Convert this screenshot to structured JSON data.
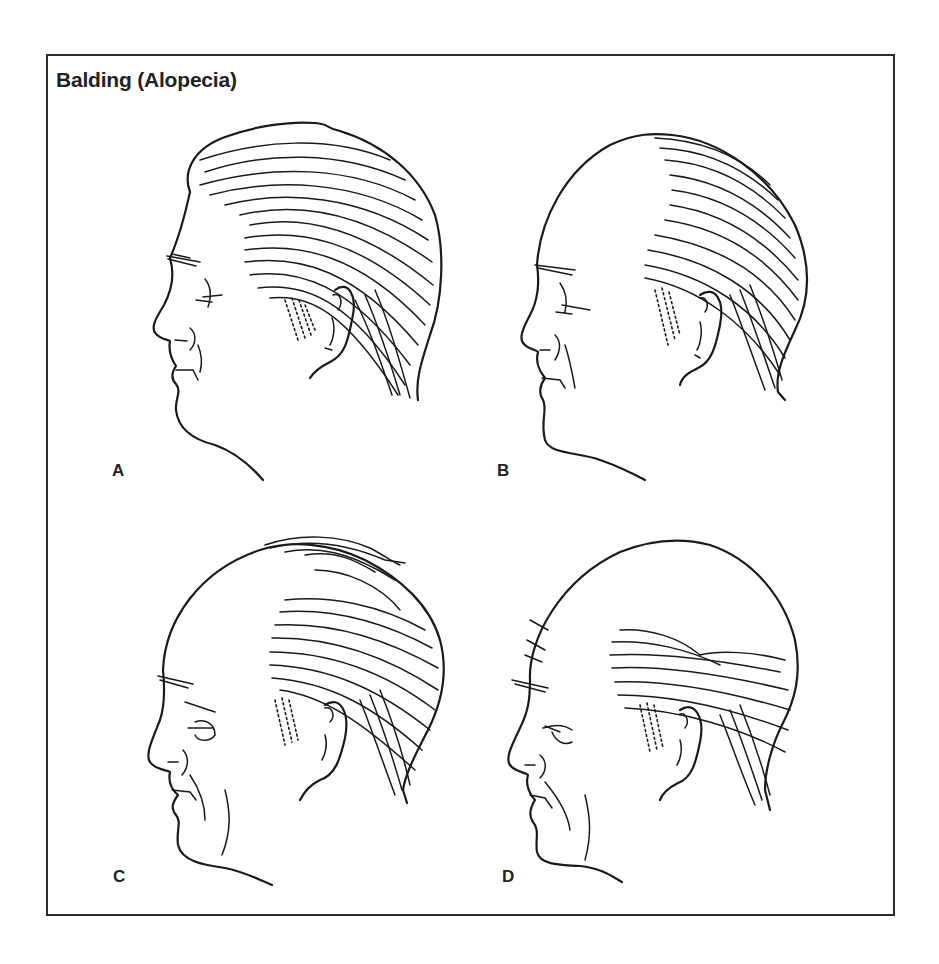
{
  "figure": {
    "title": "Balding (Alopecia)",
    "panels": [
      {
        "label": "A",
        "description": "Full head of hair"
      },
      {
        "label": "B",
        "description": "Receding hairline, bald crown front"
      },
      {
        "label": "C",
        "description": "Advanced balding with comb-over strands"
      },
      {
        "label": "D",
        "description": "Extensive baldness, hair on sides and back only"
      }
    ]
  },
  "colors": {
    "ink": "#1a1a1a",
    "background": "#ffffff",
    "frame": "#2a2a2a"
  }
}
